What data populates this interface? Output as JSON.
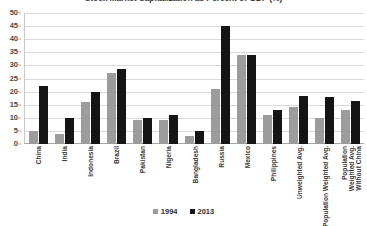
{
  "chart_data": {
    "type": "bar",
    "title": "Stock Market Capitalization as Percent of GDP (%)",
    "xlabel": "",
    "ylabel": "",
    "ylim": [
      0,
      50
    ],
    "ytick_step": 5,
    "yticks": [
      50,
      45,
      40,
      35,
      30,
      25,
      20,
      15,
      10,
      5,
      0
    ],
    "grid": true,
    "legend_position": "bottom",
    "categories": [
      "China",
      "India",
      "Indonesia",
      "Brazil",
      "Pakistan",
      "Nigeria",
      "Bangladesh",
      "Russia",
      "Mexico",
      "Philippines",
      "Unweighted Avg.",
      "Population Weighted Avg.",
      "Population Weighted Avg. Without China"
    ],
    "series": [
      {
        "name": "1994",
        "color": "#9c9c9c",
        "values": [
          5,
          4,
          16,
          27,
          9,
          9,
          3,
          21,
          34,
          11,
          14,
          10,
          13
        ]
      },
      {
        "name": "2013",
        "color": "#151515",
        "values": [
          22,
          10,
          20,
          28.5,
          10,
          11,
          5,
          45,
          34,
          13,
          18.5,
          18,
          16.5
        ]
      }
    ]
  },
  "legend": {
    "entries": [
      {
        "label": "1994",
        "color": "#9c9c9c"
      },
      {
        "label": "2013",
        "color": "#151515"
      }
    ]
  }
}
